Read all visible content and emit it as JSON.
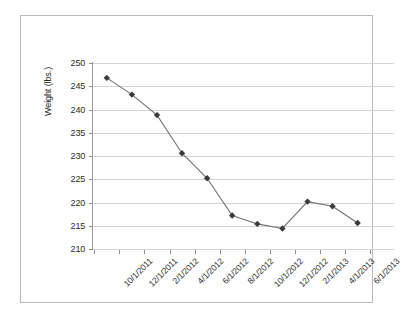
{
  "chart_data": {
    "type": "line",
    "title": "",
    "xlabel": "",
    "ylabel": "Weight (lbs.)",
    "ylim": [
      210,
      250
    ],
    "ytick_step": 5,
    "yticks": [
      210,
      215,
      220,
      225,
      230,
      235,
      240,
      245,
      250
    ],
    "grid": true,
    "legend": "none",
    "marker": "diamond",
    "line_color": "#707070",
    "marker_color": "#3b3b3b",
    "categories": [
      "10/1/2011",
      "12/1/2011",
      "2/1/2012",
      "4/1/2012",
      "6/1/2012",
      "8/1/2012",
      "10/1/2012",
      "12/1/2012",
      "2/1/2013",
      "4/1/2013",
      "6/1/2013"
    ],
    "x": [
      "10/1/2011",
      "11/1/2011",
      "1/1/2012",
      "3/1/2012",
      "5/1/2012",
      "7/1/2012",
      "9/1/2012",
      "11/1/2012",
      "1/1/2013",
      "4/1/2013",
      "6/15/2013"
    ],
    "values": [
      246.8,
      243.2,
      238.8,
      230.6,
      225.2,
      217.2,
      215.4,
      214.4,
      220.2,
      219.2,
      215.6
    ]
  }
}
